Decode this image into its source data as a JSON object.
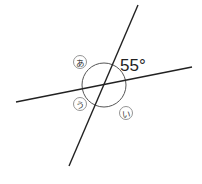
{
  "diagram": {
    "given_angle": {
      "value": "55°",
      "position": "upper-right"
    },
    "angle_labels": [
      {
        "id": "a",
        "text": "あ",
        "position": "upper-left"
      },
      {
        "id": "i",
        "text": "い",
        "position": "lower-right"
      },
      {
        "id": "u",
        "text": "う",
        "position": "lower-left"
      }
    ],
    "colors": {
      "line": "#222222",
      "circle": "#555555",
      "label_circle": "#888888",
      "text": "#222222"
    }
  }
}
